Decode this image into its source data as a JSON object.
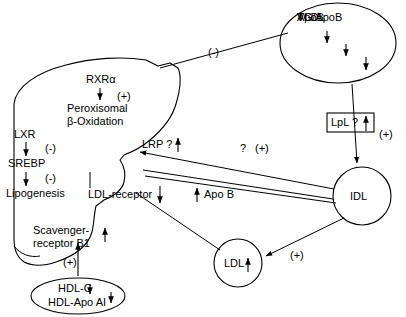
{
  "diagram": {
    "background_color": "#ffffff",
    "stroke_color": "#000000",
    "organ": {
      "name": "liver",
      "label": ""
    },
    "nodes": {
      "vldl": {
        "shape": "ellipse",
        "lines": [
          {
            "text": "VLDL",
            "arrow": ""
          },
          {
            "text": "TG",
            "arrow": "↓"
          },
          {
            "text": "ApoB",
            "arrow": "↓"
          },
          {
            "text": "TG/ApoB",
            "arrow": "↓"
          }
        ]
      },
      "idl": {
        "shape": "circle",
        "label": "IDL",
        "arrow": ""
      },
      "ldl": {
        "shape": "circle",
        "label": "LDL",
        "arrow": "↑"
      },
      "hdl": {
        "shape": "ellipse",
        "lines": [
          {
            "text": "HDL-C",
            "arrow": "↓"
          },
          {
            "text": "HDL-Apo AI",
            "arrow": "↓"
          }
        ]
      },
      "lpl": {
        "shape": "box",
        "label": "LpL ?",
        "arrow": "↑"
      }
    },
    "liver_pathways": {
      "rxr": {
        "top_label": "RXRα",
        "sign": "(+)",
        "target_line1": "Peroxisomal",
        "target_line2": "β-Oxidation"
      },
      "lxr": {
        "top_label": "LXR",
        "sign1": "(-)",
        "mid_label": "SREBP",
        "sign2": "(-)",
        "bottom_label": "Lipogenesis"
      },
      "lrp": {
        "label": "LRP ?",
        "arrow": "↑"
      },
      "ldl_receptor": {
        "label": "LDL-receptor",
        "arrow": "↓"
      },
      "scavenger": {
        "line1": "Scavenger-",
        "line2": "receptor B1",
        "arrow": "↑"
      }
    },
    "edge_labels": {
      "liver_to_vldl": "(-)",
      "vldl_to_idl": "(+)",
      "idl_to_ldl": "(+)",
      "hdl_to_scavenger": "(+)",
      "idl_question": "?",
      "idl_question_sign": "(+)",
      "apob": "Apo B",
      "apob_arrow": "↑"
    }
  }
}
